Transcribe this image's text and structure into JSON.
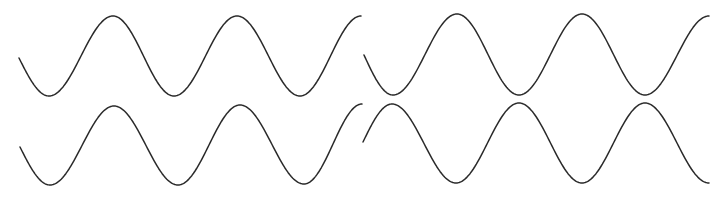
{
  "canvas": {
    "width": 726,
    "height": 204,
    "background": "#ffffff"
  },
  "style": {
    "stroke": "#2a2a2a",
    "stroke_width": 1.5
  },
  "chart_data": [
    {
      "type": "line",
      "title": "",
      "xlabel": "",
      "ylabel": "",
      "grid": false,
      "panel": "top-left",
      "function": "sine",
      "x_range_px": [
        19,
        361
      ],
      "center_y_px": 56,
      "amplitude_px": 40,
      "period_px": 125.5,
      "phase_note": "starts near midline descending to trough",
      "points": [
        [
          19,
          58
        ],
        [
          49,
          96
        ],
        [
          113,
          16
        ],
        [
          174,
          96
        ],
        [
          237,
          16
        ],
        [
          300,
          96
        ],
        [
          361,
          16
        ]
      ]
    },
    {
      "type": "line",
      "title": "",
      "xlabel": "",
      "ylabel": "",
      "grid": false,
      "panel": "top-right",
      "function": "sine",
      "x_range_px": [
        364,
        709
      ],
      "center_y_px": 55,
      "amplitude_px": 40.5,
      "period_px": 126,
      "phase_note": "starts near midline descending to trough",
      "points": [
        [
          364,
          55
        ],
        [
          393,
          95
        ],
        [
          457,
          14
        ],
        [
          519,
          95
        ],
        [
          582,
          14
        ],
        [
          645,
          95
        ],
        [
          709,
          16
        ]
      ]
    },
    {
      "type": "line",
      "title": "",
      "xlabel": "",
      "ylabel": "",
      "grid": false,
      "panel": "bottom-left",
      "function": "sine",
      "x_range_px": [
        20,
        362
      ],
      "center_y_px": 145,
      "amplitude_px": 40,
      "period_px": 127,
      "phase_note": "starts near midline descending to trough",
      "points": [
        [
          20,
          147
        ],
        [
          50,
          185
        ],
        [
          114,
          106
        ],
        [
          178,
          185
        ],
        [
          240,
          105
        ],
        [
          304,
          184
        ],
        [
          362,
          104
        ]
      ]
    },
    {
      "type": "line",
      "title": "",
      "xlabel": "",
      "ylabel": "",
      "grid": false,
      "panel": "bottom-right",
      "function": "sine",
      "x_range_px": [
        363,
        709
      ],
      "center_y_px": 143,
      "amplitude_px": 40,
      "period_px": 126.5,
      "phase_note": "starts near midline ascending to peak",
      "points": [
        [
          363,
          142
        ],
        [
          392,
          104
        ],
        [
          456,
          183
        ],
        [
          519,
          103
        ],
        [
          582,
          183
        ],
        [
          645,
          103
        ],
        [
          709,
          183
        ]
      ]
    }
  ]
}
